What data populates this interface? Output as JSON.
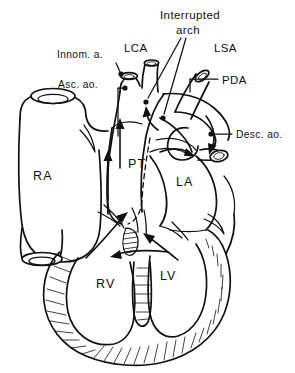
{
  "figure": {
    "background_color": "#ffffff",
    "ink_color": "#111111",
    "style": "black-and-white anatomical line drawing"
  },
  "labels": {
    "innominate_artery": "Innom. a.",
    "ascending_aorta": "Asc. ao.",
    "left_carotid_artery": "LCA",
    "interrupted_arch_line1": "Interrupted",
    "interrupted_arch_line2": "arch",
    "left_subclavian_artery": "LSA",
    "patent_ductus_arteriosus": "PDA",
    "descending_aorta": "Desc. ao.",
    "right_atrium": "RA",
    "pulmonary_trunk": "PT",
    "left_atrium": "LA",
    "right_ventricle": "RV",
    "left_ventricle": "LV"
  },
  "structures": [
    {
      "name": "right-atrium",
      "abbr": "RA"
    },
    {
      "name": "right-ventricle",
      "abbr": "RV"
    },
    {
      "name": "left-ventricle",
      "abbr": "LV"
    },
    {
      "name": "left-atrium",
      "abbr": "LA"
    },
    {
      "name": "pulmonary-trunk",
      "abbr": "PT"
    },
    {
      "name": "ascending-aorta",
      "abbr": "Asc. ao."
    },
    {
      "name": "innominate-artery",
      "abbr": "Innom. a."
    },
    {
      "name": "left-carotid-artery",
      "abbr": "LCA"
    },
    {
      "name": "left-subclavian-artery",
      "abbr": "LSA"
    },
    {
      "name": "patent-ductus-arteriosus",
      "abbr": "PDA"
    },
    {
      "name": "descending-aorta",
      "abbr": "Desc. ao."
    },
    {
      "name": "interrupted-arch",
      "abbr": "Interrupted arch"
    }
  ]
}
